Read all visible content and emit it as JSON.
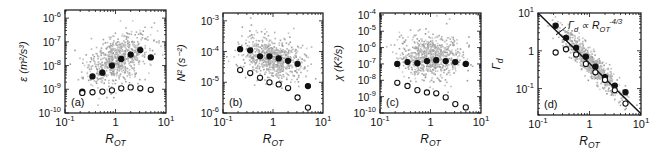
{
  "figure": {
    "background": "#ffffff",
    "scatter_color": "#a8a8a8",
    "marker_color": "#111111",
    "line_color": "#111111"
  },
  "chart_data": [
    {
      "type": "scatter",
      "panel_label": "(a)",
      "xlabel": "R_OT",
      "ylabel": "ε (m²/s³)",
      "xscale": "log",
      "yscale": "log",
      "xlim": [
        0.1,
        10
      ],
      "ylim": [
        1e-10,
        2.2e-06
      ],
      "xticks": [
        {
          "v": 0.1,
          "label": "10",
          "exp": "-1"
        },
        {
          "v": 1,
          "label": "1",
          "exp": ""
        },
        {
          "v": 10,
          "label": "10",
          "exp": "1"
        }
      ],
      "yticks": [
        {
          "v": 1e-10,
          "label": "10",
          "exp": "-10"
        },
        {
          "v": 1e-09,
          "label": "10",
          "exp": "-9"
        },
        {
          "v": 1e-08,
          "label": "10",
          "exp": "-8"
        },
        {
          "v": 1e-07,
          "label": "10",
          "exp": "-7"
        },
        {
          "v": 1e-06,
          "label": "10",
          "exp": "-6"
        }
      ],
      "cloud": {
        "center_x": 1.0,
        "center_y": 2e-08,
        "spread_x_dec": 0.32,
        "spread_y_dec": 0.55,
        "corr": 0.45,
        "n": 700
      },
      "series": [
        {
          "name": "filled",
          "marker": "filled-circle",
          "x": [
            0.22,
            0.35,
            0.55,
            0.85,
            1.3,
            2.0,
            3.1,
            5.0
          ],
          "y": [
            8e-10,
            3.5e-09,
            5e-09,
            1e-08,
            1.9e-08,
            2.9e-08,
            4.5e-08,
            2.2e-08
          ]
        },
        {
          "name": "open",
          "marker": "open-circle",
          "x": [
            0.22,
            0.35,
            0.55,
            0.85,
            1.3,
            2.0,
            3.1,
            5.0
          ],
          "y": [
            7e-10,
            7.5e-10,
            8e-10,
            9e-10,
            1.1e-09,
            1.2e-09,
            1.1e-09,
            9.5e-10
          ]
        }
      ],
      "box": {
        "x": 65,
        "y": 10,
        "w": 101,
        "h": 103
      }
    },
    {
      "type": "scatter",
      "panel_label": "(b)",
      "xlabel": "R_OT",
      "ylabel": "N² (s⁻²)",
      "xscale": "log",
      "yscale": "log",
      "xlim": [
        0.1,
        10
      ],
      "ylim": [
        1e-06,
        0.0018
      ],
      "xticks": [
        {
          "v": 0.1,
          "label": "10",
          "exp": "-1"
        },
        {
          "v": 1,
          "label": "1",
          "exp": ""
        },
        {
          "v": 10,
          "label": "10",
          "exp": "1"
        }
      ],
      "yticks": [
        {
          "v": 1e-06,
          "label": "10",
          "exp": "-6"
        },
        {
          "v": 1e-05,
          "label": "10",
          "exp": "-5"
        },
        {
          "v": 0.0001,
          "label": "10",
          "exp": "-4"
        },
        {
          "v": 0.001,
          "label": "10",
          "exp": "-3"
        }
      ],
      "cloud": {
        "center_x": 1.0,
        "center_y": 6e-05,
        "spread_x_dec": 0.3,
        "spread_y_dec": 0.35,
        "corr": -0.3,
        "n": 700
      },
      "series": [
        {
          "name": "filled",
          "marker": "filled-circle",
          "x": [
            0.22,
            0.35,
            0.55,
            0.85,
            1.3,
            2.0,
            3.1,
            5.0
          ],
          "y": [
            0.00012,
            0.00011,
            7e-05,
            7e-05,
            6e-05,
            5e-05,
            4e-05,
            7.5e-06
          ]
        },
        {
          "name": "open",
          "marker": "open-circle",
          "x": [
            0.22,
            0.35,
            0.55,
            0.85,
            1.3,
            2.0,
            3.1,
            5.0
          ],
          "y": [
            2.5e-05,
            2e-05,
            1.4e-05,
            1e-05,
            8.5e-06,
            6.5e-06,
            3.2e-06,
            1.5e-06
          ]
        }
      ],
      "box": {
        "x": 223,
        "y": 13,
        "w": 100,
        "h": 100
      }
    },
    {
      "type": "scatter",
      "panel_label": "(c)",
      "xlabel": "R_OT",
      "ylabel": "χ (K²/s)",
      "xscale": "log",
      "yscale": "log",
      "xlim": [
        0.1,
        10
      ],
      "ylim": [
        1e-10,
        0.00013
      ],
      "xticks": [
        {
          "v": 0.1,
          "label": "10",
          "exp": "-1"
        },
        {
          "v": 1,
          "label": "1",
          "exp": ""
        },
        {
          "v": 10,
          "label": "10",
          "exp": "1"
        }
      ],
      "yticks": [
        {
          "v": 1e-10,
          "label": "10",
          "exp": "-10"
        },
        {
          "v": 1e-09,
          "label": "10",
          "exp": "-9"
        },
        {
          "v": 1e-08,
          "label": "10",
          "exp": "-8"
        },
        {
          "v": 1e-07,
          "label": "10",
          "exp": "-7"
        },
        {
          "v": 1e-06,
          "label": "10",
          "exp": "-6"
        },
        {
          "v": 1e-05,
          "label": "10",
          "exp": "-5"
        },
        {
          "v": 0.0001,
          "label": "10",
          "exp": "-4"
        }
      ],
      "cloud": {
        "center_x": 1.0,
        "center_y": 3e-07,
        "spread_x_dec": 0.3,
        "spread_y_dec": 0.7,
        "corr": 0.0,
        "n": 700
      },
      "series": [
        {
          "name": "filled",
          "marker": "filled-circle",
          "x": [
            0.22,
            0.35,
            0.55,
            0.85,
            1.3,
            2.0,
            3.1,
            5.0
          ],
          "y": [
            1e-07,
            1.3e-07,
            1.1e-07,
            1.5e-07,
            1.7e-07,
            1.5e-07,
            1.3e-07,
            1e-07
          ]
        },
        {
          "name": "open",
          "marker": "open-circle",
          "x": [
            0.22,
            0.35,
            0.55,
            0.85,
            1.3,
            2.0,
            3.1,
            5.0
          ],
          "y": [
            7e-09,
            4.5e-09,
            2.5e-09,
            1.8e-09,
            1.6e-09,
            9e-10,
            3.5e-10,
            2.2e-10
          ]
        }
      ],
      "box": {
        "x": 380,
        "y": 13,
        "w": 101,
        "h": 100
      }
    },
    {
      "type": "scatter",
      "panel_label": "(d)",
      "xlabel": "R_OT",
      "ylabel": "Γ_d",
      "xscale": "log",
      "yscale": "log",
      "xlim": [
        0.1,
        10
      ],
      "ylim": [
        0.02,
        10
      ],
      "xticks": [
        {
          "v": 0.1,
          "label": "10",
          "exp": "-1"
        },
        {
          "v": 1,
          "label": "1",
          "exp": ""
        },
        {
          "v": 10,
          "label": "10",
          "exp": "1"
        }
      ],
      "yticks": [
        {
          "v": 0.1,
          "label": "10",
          "exp": "-1"
        },
        {
          "v": 1,
          "label": "1",
          "exp": ""
        },
        {
          "v": 10,
          "label": "10",
          "exp": "1"
        }
      ],
      "cloud": {
        "center_x": 1.0,
        "center_y": 0.5,
        "spread_x_dec": 0.3,
        "spread_y_dec": 0.45,
        "corr": -0.92,
        "n": 700
      },
      "annotation": {
        "text": "Γ_d ∝ R_OT^(-4/3)",
        "main": "Γ",
        "sub": "d",
        "prop": " ∝ R",
        "sub2": "OT",
        "exp": "-4/3"
      },
      "fit_line": {
        "x": [
          0.1,
          10
        ],
        "y": [
          10,
          0.0215
        ],
        "slope": -1.3333
      },
      "series": [
        {
          "name": "filled",
          "marker": "filled-circle",
          "x": [
            0.22,
            0.35,
            0.55,
            0.85,
            1.3,
            2.0,
            3.1,
            5.0
          ],
          "y": [
            4.6,
            2.2,
            1.2,
            0.7,
            0.38,
            0.2,
            0.12,
            0.08
          ]
        },
        {
          "name": "open",
          "marker": "open-circle",
          "x": [
            0.22,
            0.35,
            0.55,
            0.85,
            1.3,
            2.0,
            3.1,
            5.0
          ],
          "y": [
            0.9,
            1.1,
            0.8,
            0.45,
            0.27,
            0.17,
            0.09,
            0.04
          ]
        }
      ],
      "box": {
        "x": 538,
        "y": 13,
        "w": 103,
        "h": 102
      }
    }
  ]
}
